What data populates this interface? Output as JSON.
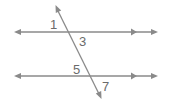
{
  "diagram": {
    "line_color": "#8a8a8a",
    "label_color": "#6b6b6b",
    "lines": [
      {
        "name": "top-parallel-line",
        "x1": 15,
        "y1": 32,
        "x2": 157,
        "y2": 32
      },
      {
        "name": "bottom-parallel-line",
        "x1": 15,
        "y1": 76,
        "x2": 157,
        "y2": 76
      },
      {
        "name": "transversal",
        "x1": 56,
        "y1": 6,
        "x2": 101,
        "y2": 98
      }
    ],
    "angle_labels": [
      {
        "text": "1",
        "x": 50,
        "y": 29
      },
      {
        "text": "3",
        "x": 79,
        "y": 46
      },
      {
        "text": "5",
        "x": 73,
        "y": 74
      },
      {
        "text": "7",
        "x": 102,
        "y": 91
      }
    ]
  }
}
